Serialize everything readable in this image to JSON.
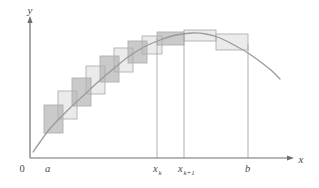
{
  "figure": {
    "background_color": "#ffffff",
    "axis_color": "#6e6e6e",
    "curve_color": "#9a9a9a",
    "rect_stroke_color": "#b0b0b0",
    "rect_fill_light": "#ebebeb",
    "rect_fill_dark": "#bfbfbf",
    "drop_line_color": "#a8a8a8"
  },
  "axes": {
    "y_label": "y",
    "x_label": "x",
    "origin_label": "0",
    "x_axis": {
      "y": 158,
      "x_start": 30,
      "x_end": 292,
      "arrow": true
    },
    "y_axis": {
      "x": 30,
      "y_start": 158,
      "y_end": 18,
      "arrow": true
    }
  },
  "tick_labels": [
    {
      "name": "a",
      "text": "a",
      "sub": "",
      "x": 45,
      "y": 172
    },
    {
      "name": "x-k",
      "text": "x",
      "sub": "k",
      "x": 153,
      "y": 172
    },
    {
      "name": "x-k-plus-1",
      "text": "x",
      "sub": "k+1",
      "x": 178,
      "y": 172
    },
    {
      "name": "b",
      "text": "b",
      "sub": "",
      "x": 245,
      "y": 172
    }
  ],
  "drop_lines": [
    {
      "name": "drop-line-xk",
      "x": 157,
      "y_top": 38,
      "y_bottom": 158
    },
    {
      "name": "drop-line-xk1",
      "x": 184,
      "y_top": 33,
      "y_bottom": 158
    },
    {
      "name": "drop-line-b",
      "x": 248,
      "y_top": 44,
      "y_bottom": 158
    }
  ],
  "chart_data": {
    "type": "area",
    "xlabel": "x",
    "ylabel": "y",
    "grid": false,
    "legend": "none",
    "xlim": [
      30,
      292
    ],
    "ylim": [
      18,
      158
    ],
    "curve_points": [
      [
        33,
        152
      ],
      [
        40,
        142
      ],
      [
        48,
        131
      ],
      [
        58,
        120
      ],
      [
        70,
        108
      ],
      [
        84,
        95
      ],
      [
        98,
        82
      ],
      [
        112,
        70
      ],
      [
        128,
        57
      ],
      [
        144,
        47
      ],
      [
        160,
        40
      ],
      [
        176,
        35
      ],
      [
        192,
        33
      ],
      [
        206,
        34
      ],
      [
        220,
        38
      ],
      [
        234,
        45
      ],
      [
        248,
        53
      ],
      [
        262,
        63
      ],
      [
        272,
        71
      ],
      [
        280,
        79
      ]
    ],
    "rectangles": [
      {
        "name": "rect-1",
        "x": 44,
        "y": 105,
        "w": 19,
        "h": 28
      },
      {
        "name": "rect-2",
        "x": 58,
        "y": 91,
        "w": 19,
        "h": 28
      },
      {
        "name": "rect-3",
        "x": 72,
        "y": 78,
        "w": 19,
        "h": 28
      },
      {
        "name": "rect-4",
        "x": 86,
        "y": 66,
        "w": 19,
        "h": 28
      },
      {
        "name": "rect-5",
        "x": 100,
        "y": 56,
        "w": 19,
        "h": 26
      },
      {
        "name": "rect-6",
        "x": 114,
        "y": 48,
        "w": 19,
        "h": 24
      },
      {
        "name": "rect-7",
        "x": 128,
        "y": 41,
        "w": 19,
        "h": 22
      },
      {
        "name": "rect-8",
        "x": 142,
        "y": 36,
        "w": 20,
        "h": 18
      },
      {
        "name": "rect-9",
        "x": 157,
        "y": 32,
        "w": 27,
        "h": 13
      },
      {
        "name": "rect-10",
        "x": 184,
        "y": 30,
        "w": 32,
        "h": 11
      },
      {
        "name": "rect-11",
        "x": 216,
        "y": 34,
        "w": 32,
        "h": 16
      }
    ],
    "overlap_squares": [
      {
        "name": "overlap-1",
        "x": 58,
        "y": 105,
        "w": 5,
        "h": 14
      },
      {
        "name": "overlap-2",
        "x": 72,
        "y": 91,
        "w": 5,
        "h": 15
      },
      {
        "name": "overlap-3",
        "x": 86,
        "y": 78,
        "w": 5,
        "h": 16
      },
      {
        "name": "overlap-4",
        "x": 100,
        "y": 66,
        "w": 5,
        "h": 16
      },
      {
        "name": "overlap-5",
        "x": 114,
        "y": 56,
        "w": 5,
        "h": 16
      },
      {
        "name": "overlap-6",
        "x": 128,
        "y": 48,
        "w": 5,
        "h": 15
      },
      {
        "name": "overlap-7",
        "x": 142,
        "y": 41,
        "w": 5,
        "h": 13
      }
    ],
    "shaded_steps": [
      {
        "name": "step-shade-1",
        "x": 44,
        "y": 105,
        "w": 19,
        "h": 28
      },
      {
        "name": "step-shade-2",
        "x": 72,
        "y": 78,
        "w": 19,
        "h": 28
      },
      {
        "name": "step-shade-3",
        "x": 100,
        "y": 56,
        "w": 19,
        "h": 26
      },
      {
        "name": "step-shade-4",
        "x": 128,
        "y": 41,
        "w": 19,
        "h": 22
      },
      {
        "name": "step-shade-5",
        "x": 157,
        "y": 32,
        "w": 27,
        "h": 13
      }
    ]
  }
}
